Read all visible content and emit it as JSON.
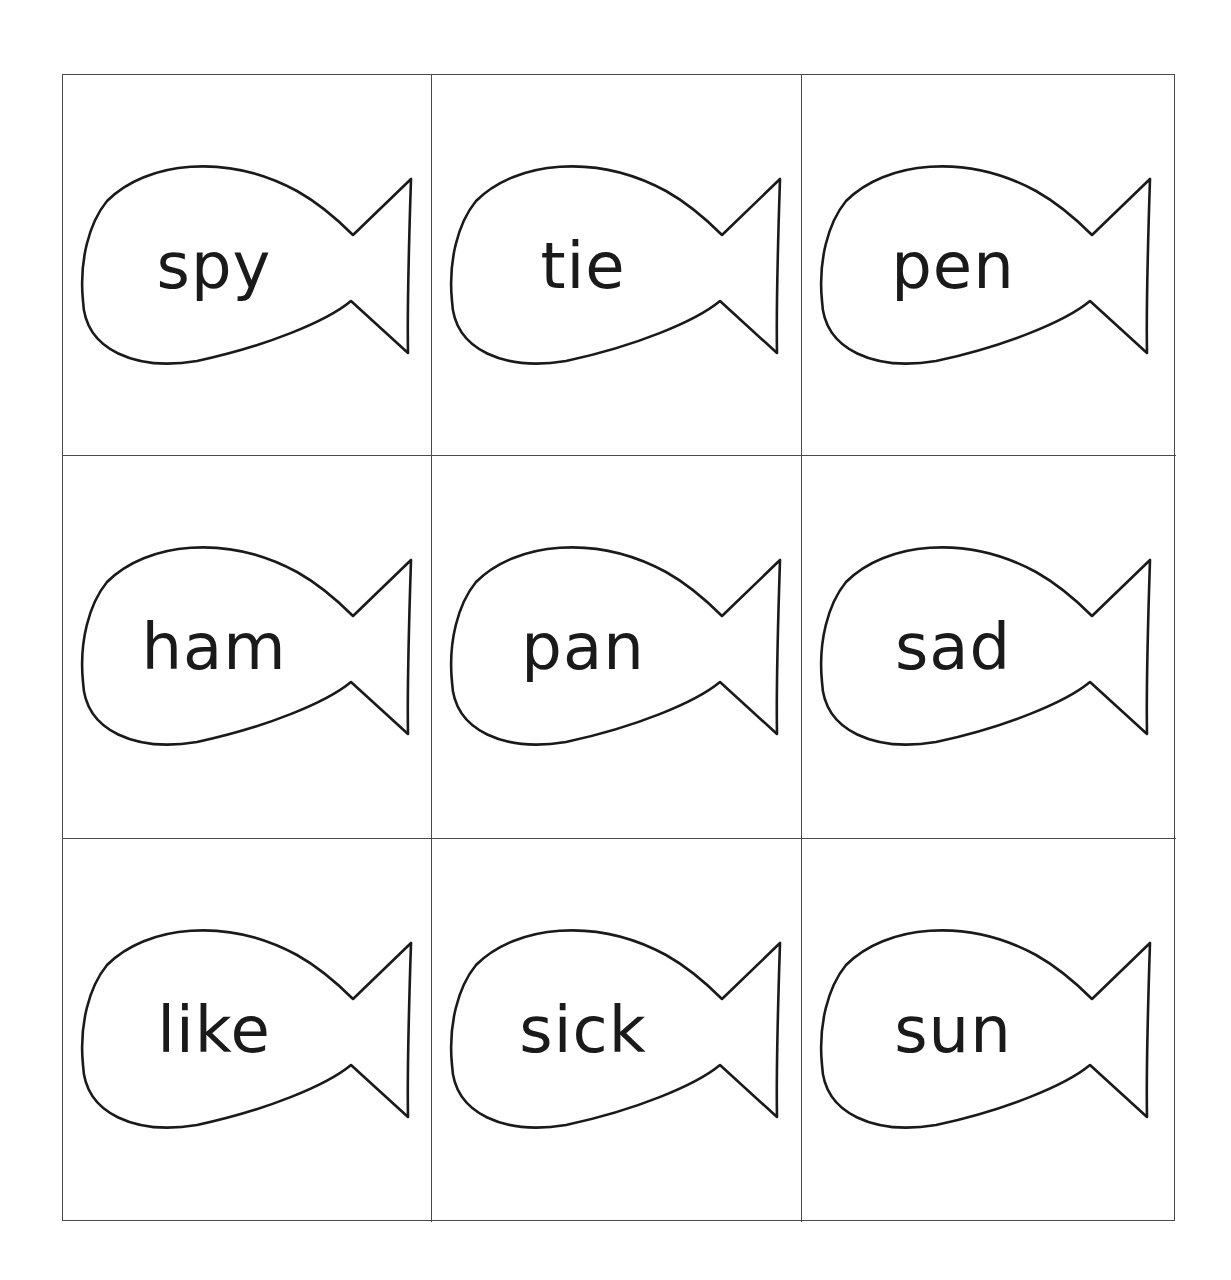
{
  "worksheet": {
    "layout": {
      "rows": 3,
      "columns": 3
    },
    "card_shape": "fish",
    "line_color": "#4a4a4a",
    "text_color": "#1a1a1a",
    "cards": [
      {
        "row": 1,
        "col": 1,
        "word": "spy"
      },
      {
        "row": 1,
        "col": 2,
        "word": "tie"
      },
      {
        "row": 1,
        "col": 3,
        "word": "pen"
      },
      {
        "row": 2,
        "col": 1,
        "word": "ham"
      },
      {
        "row": 2,
        "col": 2,
        "word": "pan"
      },
      {
        "row": 2,
        "col": 3,
        "word": "sad"
      },
      {
        "row": 3,
        "col": 1,
        "word": "like"
      },
      {
        "row": 3,
        "col": 2,
        "word": "sick"
      },
      {
        "row": 3,
        "col": 3,
        "word": "sun"
      }
    ]
  }
}
